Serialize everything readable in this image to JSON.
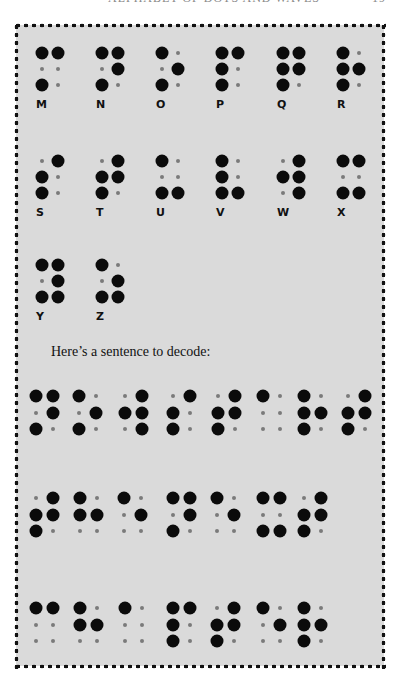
{
  "page": {
    "header_title": "ALPHABET OF DOTS AND WAVES",
    "page_number": "19",
    "background_color": "#dadada",
    "border_style": "dotted"
  },
  "alphabet": [
    {
      "letter": "M",
      "dots": [
        1,
        3,
        4
      ]
    },
    {
      "letter": "N",
      "dots": [
        1,
        3,
        4,
        5
      ]
    },
    {
      "letter": "O",
      "dots": [
        1,
        3,
        5
      ]
    },
    {
      "letter": "P",
      "dots": [
        1,
        2,
        3,
        4
      ]
    },
    {
      "letter": "Q",
      "dots": [
        1,
        2,
        3,
        4,
        5
      ]
    },
    {
      "letter": "R",
      "dots": [
        1,
        2,
        3,
        5
      ]
    },
    {
      "letter": "S",
      "dots": [
        2,
        3,
        4
      ]
    },
    {
      "letter": "T",
      "dots": [
        2,
        3,
        4,
        5
      ]
    },
    {
      "letter": "U",
      "dots": [
        1,
        3,
        6
      ]
    },
    {
      "letter": "V",
      "dots": [
        1,
        2,
        3,
        6
      ]
    },
    {
      "letter": "W",
      "dots": [
        2,
        4,
        5,
        6
      ]
    },
    {
      "letter": "X",
      "dots": [
        1,
        3,
        4,
        6
      ]
    },
    {
      "letter": "Y",
      "dots": [
        1,
        3,
        4,
        5,
        6
      ]
    },
    {
      "letter": "Z",
      "dots": [
        1,
        3,
        5,
        6
      ]
    }
  ],
  "intro_text": "Here’s a sentence to decode:",
  "sentence": {
    "rows": [
      {
        "cells": [
          {
            "x": 36,
            "dots": [
              1,
              3,
              4,
              5
            ]
          },
          {
            "x": 79,
            "dots": [
              1,
              3,
              5
            ]
          },
          {
            "x": 125,
            "dots": [
              2,
              4,
              5,
              6
            ]
          },
          {
            "x": 173,
            "dots": [
              2,
              3,
              4
            ]
          },
          {
            "x": 218,
            "dots": [
              2,
              3,
              4,
              5
            ]
          },
          {
            "x": 263,
            "dots": [
              1
            ]
          },
          {
            "x": 304,
            "dots": [
              1,
              2,
              3,
              5
            ]
          },
          {
            "x": 348,
            "dots": [
              2,
              3,
              4,
              5
            ]
          }
        ]
      },
      {
        "cells": [
          {
            "x": 36,
            "dots": [
              2,
              3,
              4,
              5
            ]
          },
          {
            "x": 80,
            "dots": [
              1,
              2,
              5
            ]
          },
          {
            "x": 124,
            "dots": [
              1,
              5
            ]
          },
          {
            "x": 173,
            "dots": [
              1,
              3,
              4,
              5
            ]
          },
          {
            "x": 217,
            "dots": [
              1,
              5
            ]
          },
          {
            "x": 263,
            "dots": [
              1,
              3,
              4,
              6
            ]
          },
          {
            "x": 304,
            "dots": [
              2,
              3,
              4,
              5
            ]
          }
        ]
      },
      {
        "cells": [
          {
            "x": 36,
            "dots": [
              1,
              4
            ]
          },
          {
            "x": 80,
            "dots": [
              1,
              2,
              5
            ]
          },
          {
            "x": 125,
            "dots": [
              1
            ]
          },
          {
            "x": 173,
            "dots": [
              1,
              2,
              3,
              4
            ]
          },
          {
            "x": 217,
            "dots": [
              2,
              3,
              4,
              5
            ]
          },
          {
            "x": 263,
            "dots": [
              1,
              5
            ]
          },
          {
            "x": 304,
            "dots": [
              1,
              2,
              3,
              5
            ]
          }
        ]
      }
    ],
    "row_tops": [
      396,
      498,
      608
    ],
    "decoded": "NOW START THE NEXT CHAPTER"
  }
}
